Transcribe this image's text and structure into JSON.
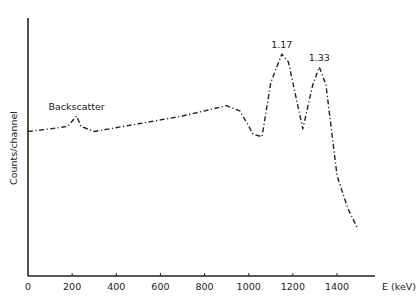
{
  "chart_data": {
    "type": "line",
    "title": "",
    "xlabel": "E (keV)",
    "ylabel": "Counts/channel",
    "xlim": [
      0,
      1500
    ],
    "ylim": [
      0,
      100
    ],
    "x_ticks": [
      0,
      200,
      400,
      600,
      800,
      1000,
      1200,
      1400
    ],
    "x_tick_labels": [
      "0",
      "200",
      "400",
      "600",
      "800",
      "1000",
      "1200",
      "1400"
    ],
    "y_ticks": [],
    "grid": false,
    "legend": null,
    "line_style": "dash-dot",
    "series": [
      {
        "name": "Gamma spectrum",
        "x": [
          0,
          100,
          180,
          220,
          240,
          300,
          500,
          700,
          900,
          960,
          1020,
          1060,
          1100,
          1150,
          1180,
          1245,
          1290,
          1320,
          1350,
          1400,
          1450,
          1490
        ],
        "values": [
          56,
          57,
          58,
          62,
          58,
          56,
          59,
          62,
          66,
          64,
          55,
          54,
          75,
          86,
          83,
          57,
          74,
          81,
          74,
          39,
          26,
          19
        ]
      }
    ],
    "annotations": [
      {
        "text": "Backscatter",
        "x": 220,
        "y": 62
      },
      {
        "text": "1.17",
        "x": 1150,
        "y": 86
      },
      {
        "text": "1.33",
        "x": 1320,
        "y": 81
      }
    ]
  },
  "axes": {
    "x_label": "E (keV)",
    "y_label": "Counts/channel"
  }
}
